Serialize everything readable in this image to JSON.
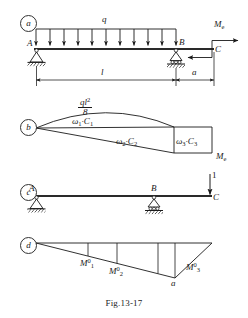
{
  "figure": {
    "caption": "Fig.13-17",
    "panels": [
      {
        "tag": "a",
        "name": "loaded-beam-panel"
      },
      {
        "tag": "b",
        "name": "bending-moment-areas-panel"
      },
      {
        "tag": "c",
        "name": "unit-load-beam-panel"
      },
      {
        "tag": "d",
        "name": "unit-moment-diagram-panel"
      }
    ]
  },
  "panel_a": {
    "load_label": "q",
    "point_a": "A",
    "point_b": "B",
    "point_c": "C",
    "moment_label": "M",
    "moment_sub": "e",
    "dim_span": "l",
    "dim_overhang": "a",
    "distributed_arrow_count": 11
  },
  "panel_b": {
    "peak_num": "ql",
    "peak_num_sup": "2",
    "peak_den": "8",
    "area1": "ω",
    "area1_sub": "1",
    "area1_c": "C",
    "area1_c_sub": "1",
    "area2": "ω",
    "area2_sub": "2",
    "area2_c": "C",
    "area2_c_sub": "2",
    "area3": "ω",
    "area3_sub": "3",
    "area3_c": "C",
    "area3_c_sub": "3",
    "moment_label": "M",
    "moment_sub": "e",
    "dot": "·"
  },
  "panel_c": {
    "point_a": "A",
    "point_b": "B",
    "point_c": "C",
    "unit_load": "1"
  },
  "panel_d": {
    "m1": "M",
    "m1_sup": "0",
    "m1_sub": "1",
    "m2": "M",
    "m2_sup": "0",
    "m2_sub": "2",
    "m3": "M",
    "m3_sup": "0",
    "m3_sub": "3",
    "dim_a": "a"
  },
  "colors": {
    "line": "#1a1a1a",
    "beam": "#2a2a2a",
    "background": "#ffffff"
  }
}
